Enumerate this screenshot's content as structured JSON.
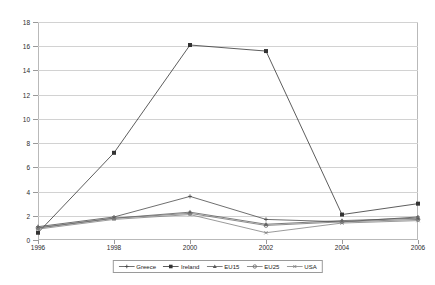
{
  "chart_data": {
    "type": "line",
    "title": "",
    "xlabel": "",
    "ylabel": "",
    "x": [
      1996,
      1998,
      2000,
      2002,
      2004,
      2006
    ],
    "categories": [
      "1996",
      "1998",
      "2000",
      "2002",
      "2004",
      "2006"
    ],
    "xlim": [
      1996,
      2006
    ],
    "ylim": [
      0,
      18
    ],
    "ytick_values": [
      0,
      2,
      4,
      6,
      8,
      10,
      12,
      14,
      16,
      18
    ],
    "ytick_labels": [
      "0",
      "2",
      "4",
      "6",
      "8",
      "10",
      "12",
      "14",
      "16",
      "18"
    ],
    "xtick_labels": [
      "1996",
      "1998",
      "2000",
      "2002",
      "2004",
      "2006"
    ],
    "grid": "horizontal",
    "legend_position": "bottom-center",
    "series": [
      {
        "name": "Greece",
        "marker": "cross",
        "color": "#4a4a4a",
        "values": [
          1.1,
          1.9,
          3.6,
          1.7,
          1.5,
          1.9
        ]
      },
      {
        "name": "Ireland",
        "marker": "square",
        "color": "#333333",
        "values": [
          0.6,
          7.2,
          16.1,
          15.6,
          2.1,
          3.0
        ]
      },
      {
        "name": "EU15",
        "marker": "triangle",
        "color": "#5a5a5a",
        "values": [
          1.0,
          1.8,
          2.3,
          1.3,
          1.6,
          1.8
        ]
      },
      {
        "name": "EU25",
        "marker": "circle",
        "color": "#707070",
        "values": [
          1.0,
          1.8,
          2.2,
          1.2,
          1.5,
          1.7
        ]
      },
      {
        "name": "USA",
        "marker": "x",
        "color": "#808080",
        "values": [
          0.9,
          1.7,
          2.1,
          0.6,
          1.4,
          1.6
        ]
      }
    ]
  },
  "legend": {
    "items": [
      {
        "label": "Greece"
      },
      {
        "label": "Ireland"
      },
      {
        "label": "EU15"
      },
      {
        "label": "EU25"
      },
      {
        "label": "USA"
      }
    ]
  }
}
